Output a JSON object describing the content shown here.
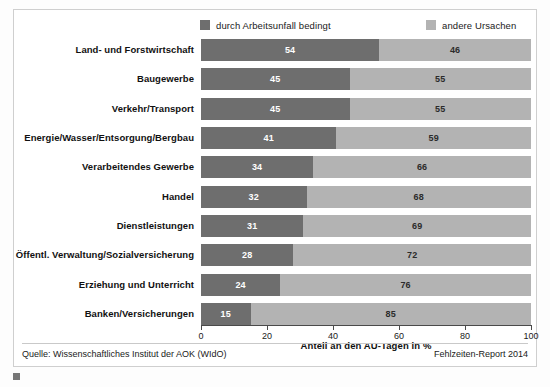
{
  "legend": {
    "entries": [
      {
        "label": "durch Arbeitsunfall bedingt",
        "color": "#6e6e6e",
        "key": "primary"
      },
      {
        "label": "andere Ursachen",
        "color": "#b3b3b3",
        "key": "secondary"
      }
    ]
  },
  "footer": {
    "source": "Quelle: Wissenschaftliches Institut der AOK (WIdO)",
    "report": "Fehlzeiten-Report 2014"
  },
  "caption": {
    "marker": "figure-marker-icon",
    "text": ""
  },
  "chart_data": {
    "type": "bar",
    "orientation": "horizontal",
    "stacked": true,
    "normalized": true,
    "title": "",
    "subtitle": "",
    "xlabel": "Anteil an den AU-Tagen in %",
    "ylabel": "",
    "xlim": [
      0,
      100
    ],
    "xticks": [
      0,
      20,
      40,
      60,
      80,
      100
    ],
    "xticklabels": [
      "0",
      "20",
      "40",
      "60",
      "80",
      "100"
    ],
    "grid": false,
    "legend_position": "top",
    "categories": [
      "Land- und Forstwirtschaft",
      "Baugewerbe",
      "Verkehr/Transport",
      "Energie/Wasser/Entsorgung/Bergbau",
      "Verarbeitendes Gewerbe",
      "Handel",
      "Dienstleistungen",
      "Öffentl. Verwaltung/Sozialversicherung",
      "Erziehung und Unterricht",
      "Banken/Versicherungen"
    ],
    "series": [
      {
        "name": "durch Arbeitsunfall bedingt",
        "color": "#6e6e6e",
        "values": [
          54,
          45,
          45,
          41,
          34,
          32,
          31,
          28,
          24,
          15
        ]
      },
      {
        "name": "andere Ursachen",
        "color": "#b3b3b3",
        "values": [
          46,
          55,
          55,
          59,
          66,
          68,
          69,
          72,
          76,
          85
        ]
      }
    ]
  }
}
